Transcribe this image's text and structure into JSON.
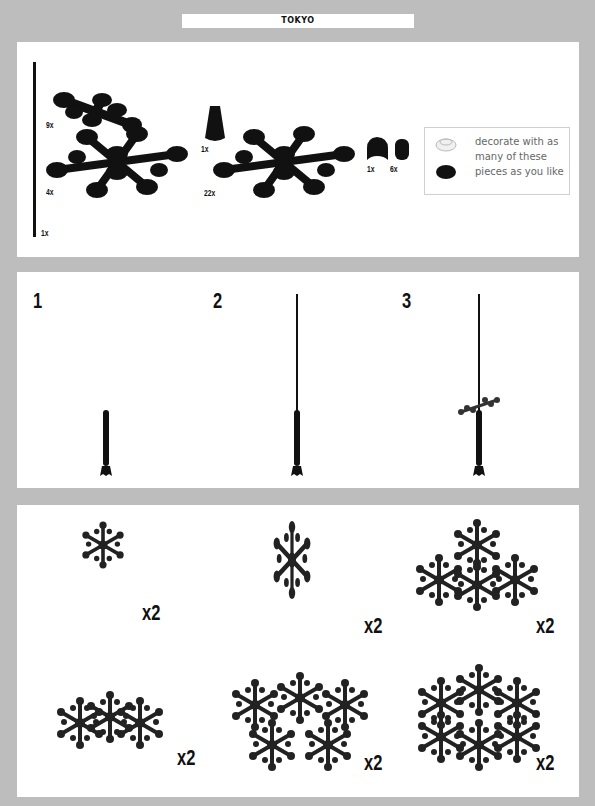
{
  "header": {
    "title": "TOKYO"
  },
  "parts_panel": {
    "parts": [
      {
        "name": "rod",
        "qty": "1x"
      },
      {
        "name": "small-leaf-plate",
        "qty": "9x"
      },
      {
        "name": "cone",
        "qty": "1x"
      },
      {
        "name": "large-leaf-plate",
        "qty": "4x"
      },
      {
        "name": "snowflake-plate",
        "qty": "22x"
      },
      {
        "name": "arch-brick",
        "qty": "1x"
      },
      {
        "name": "round-brick",
        "qty": "6x"
      }
    ],
    "note": {
      "text": "decorate with as many of these pieces as you like",
      "icons": [
        "light-round-plate-icon",
        "dark-round-plate-icon"
      ]
    }
  },
  "steps_panel": {
    "steps": [
      {
        "number": "1"
      },
      {
        "number": "2"
      },
      {
        "number": "3"
      }
    ]
  },
  "variants_panel": {
    "variants": [
      {
        "name": "single-branch",
        "multiplier": "x2"
      },
      {
        "name": "double-branch",
        "multiplier": "x2"
      },
      {
        "name": "triangle-cluster",
        "multiplier": "x2"
      },
      {
        "name": "double-cross-cluster",
        "multiplier": "x2"
      },
      {
        "name": "five-point-cluster",
        "multiplier": "x2"
      },
      {
        "name": "six-point-cluster",
        "multiplier": "x2"
      }
    ]
  },
  "colors": {
    "background": "#bdbdbd",
    "panel": "#ffffff",
    "ink": "#111111",
    "note_text": "#666666"
  }
}
